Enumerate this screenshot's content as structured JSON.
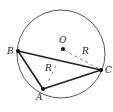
{
  "diagram": {
    "type": "geometry",
    "circle": {
      "center_label": "O",
      "radius_label": "R"
    },
    "points": [
      {
        "name": "B",
        "label": "B"
      },
      {
        "name": "C",
        "label": "C"
      },
      {
        "name": "A",
        "label": "A"
      },
      {
        "name": "O",
        "label": "O"
      }
    ],
    "segments": [
      {
        "from": "B",
        "to": "C",
        "style": "solid"
      },
      {
        "from": "B",
        "to": "A",
        "style": "solid"
      },
      {
        "from": "A",
        "to": "C",
        "style": "solid"
      },
      {
        "from": "O",
        "to": "C",
        "style": "dashed",
        "label": "R"
      },
      {
        "from": "BC-mid",
        "to": "A",
        "style": "dashed",
        "label": "R"
      }
    ],
    "labels": {
      "O": "O",
      "A": "A",
      "B": "B",
      "C": "C",
      "R_oc": "R",
      "R_a": "R"
    },
    "colors": {
      "stroke": "#222222",
      "circle": "#555555",
      "dashed": "#666666"
    }
  }
}
